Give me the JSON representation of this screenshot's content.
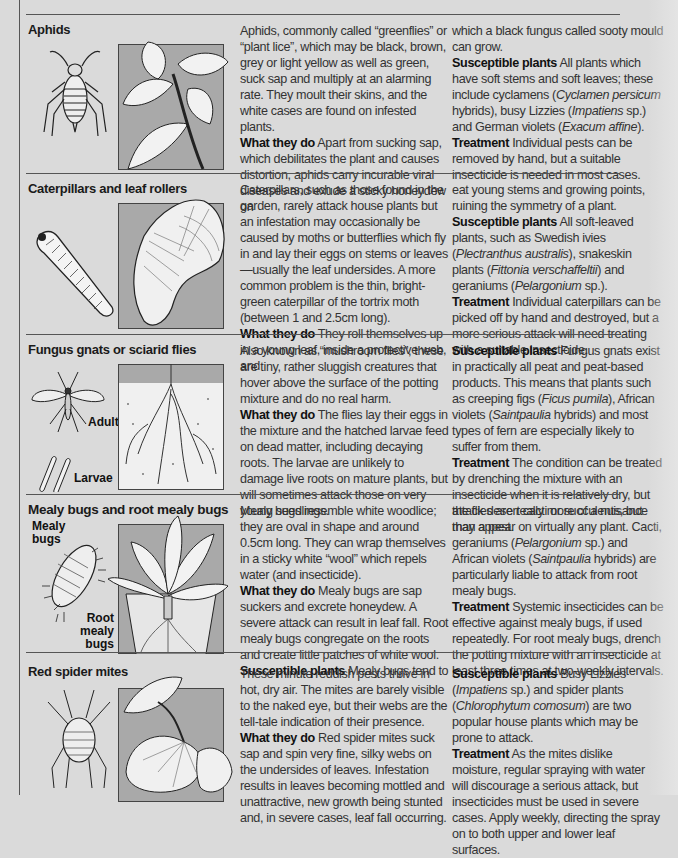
{
  "sections": [
    {
      "id": "aphids",
      "title": "Aphids",
      "col1": {
        "intro": "Aphids, commonly called “greenflies” or “plant lice”, which may be black, brown, grey or light yellow as well as green, suck sap and multiply at an alarming rate. They moult their skins, and the white cases are found on infested plants.",
        "what_label": "What they do",
        "what_text": " Apart from sucking sap, which debilitates the plant and causes distortion, aphids carry incurable viral diseases and exude a sticky honeydew on"
      },
      "col2": {
        "cont": "which a black fungus called sooty mould can grow.",
        "susceptible_label": "Susceptible plants",
        "susceptible_parts": [
          " All plants which have soft stems and soft leaves; these include cyclamens (",
          "Cyclamen persicum",
          " hybrids), busy Lizzies (",
          "Impatiens",
          " sp.) and German violets (",
          "Exacum affine",
          ")."
        ],
        "treatment_label": "Treatment",
        "treatment_text": " Individual pests can be removed by hand, but a suitable insecticide is needed in most cases."
      }
    },
    {
      "id": "caterpillars",
      "title": "Caterpillars and leaf rollers",
      "col1": {
        "intro": "Caterpillars, such as those found in the garden, rarely attack house plants but an infestation may occasionally be caused by moths or butterflies which fly in and lay their eggs on stems or leaves—usually the leaf undersides. A more common problem is the thin, bright-green caterpillar of the tortrix moth (between 1 and 2.5cm long).",
        "what_label": "What they do",
        "what_text": " They roll themselves up in a young leaf, inside a protective web, and"
      },
      "col2": {
        "cont": "eat young stems and growing points, ruining the symmetry of a plant.",
        "susceptible_label": "Susceptible plants",
        "susceptible_parts": [
          " All soft-leaved plants, such as Swedish ivies (",
          "Plectranthus australis",
          "), snakeskin plants (",
          "Fittonia verschaffeltii",
          ") and geraniums (",
          "Pelargonium",
          " sp.)."
        ],
        "treatment_label": "Treatment",
        "treatment_text": " Individual caterpillars can be picked off by hand and destroyed, but a more serious attack will need treating with a suitable insecticide."
      }
    },
    {
      "id": "fungus-gnats",
      "title": "Fungus gnats or sciarid flies",
      "labels": {
        "adult": "Adult",
        "larvae": "Larvae"
      },
      "col1": {
        "intro": "Also known as “mushroom flies”, these are tiny, rather sluggish creatures that hover above the surface of the potting mixture and do no real harm.",
        "what_label": "What they do",
        "what_text": " The flies lay their eggs in the mixture and the hatched larvae feed on dead matter, including decaying roots. The larvae are unlikely to damage live roots on mature plants, but will sometimes attack those on very young seedlings."
      },
      "col2": {
        "cont": "",
        "susceptible_label": "Susceptible plants",
        "susceptible_parts": [
          " Fungus gnats exist in practically all peat and peat-based products. This means that plants such as creeping figs (",
          "Ficus pumila",
          "), African violets (",
          "Saintpaulia",
          " hybrids) and most types of fern are especially likely to suffer from them."
        ],
        "treatment_label": "Treatment",
        "treatment_text": " The condition can be treated by drenching the mixture with an insecticide when it is relatively dry, but the flies are really more of a nuisance than a pest."
      }
    },
    {
      "id": "mealy-bugs",
      "title": "Mealy bugs and root mealy bugs",
      "labels": {
        "mealy": "Mealy bugs",
        "root": "Root mealy bugs"
      },
      "col1": {
        "intro": "Mealy bugs resemble white woodlice; they are oval in shape and around 0.5cm long. They can wrap themselves in a sticky white “wool” which repels water (and insecticide).",
        "what_label": "What they do",
        "what_text": " Mealy bugs are sap suckers and excrete honeydew. A severe attack can result in leaf fall. Root mealy bugs congregate on the roots and create little patches of white wool.",
        "susceptible_label": "Susceptible plants",
        "susceptible_text": " Mealy bugs tend to"
      },
      "col2": {
        "cont_parts": [
          "attack desert cacti or succulents, but may appear on virtually any plant. Cacti, geraniums (",
          "Pelargonium",
          " sp.) and African violets (",
          "Saintpaulia",
          " hybrids) are particularly liable to attack from root mealy bugs."
        ],
        "treatment_label": "Treatment",
        "treatment_text": " Systemic insecticides can be effective against mealy bugs, if used repeatedly. For root mealy bugs, drench the potting mixture with an insecticide at least three times at two-weekly intervals."
      }
    },
    {
      "id": "red-spider-mites",
      "title": "Red spider mites",
      "col1": {
        "intro": "These minute reddish pests thrive in hot, dry air. The mites are barely visible to the naked eye, but their webs are the tell-tale indication of their presence.",
        "what_label": "What they do",
        "what_text": " Red spider mites suck sap and spin very fine, silky webs on the undersides of leaves. Infestation results in leaves becoming mottled and unattractive, new growth being stunted and, in severe cases, leaf fall occurring."
      },
      "col2": {
        "susceptible_label": "Susceptible plants",
        "susceptible_parts": [
          " Busy Lizzies (",
          "Impatiens",
          " sp.) and spider plants (",
          "Chlorophytum comosum",
          ") are two popular house plants which may be prone to attack."
        ],
        "treatment_label": "Treatment",
        "treatment_text": " As the mites dislike moisture, regular spraying with water will discourage a serious attack, but insecticides must be used in severe cases. Apply weekly, directing the spray on to both upper and lower leaf surfaces."
      }
    }
  ]
}
